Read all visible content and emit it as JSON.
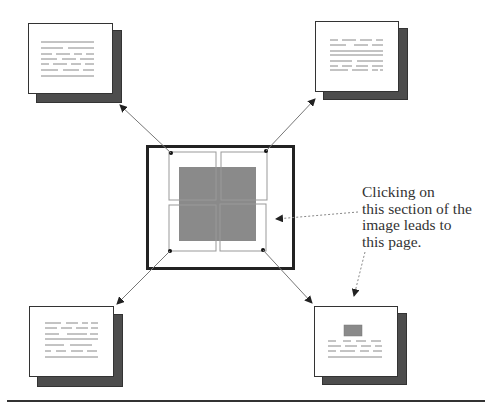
{
  "diagram": {
    "center_image": {
      "label": "image-map",
      "quadrants": [
        "top-left",
        "top-right",
        "bottom-left",
        "bottom-right"
      ],
      "fill_color": "#8a8a8a"
    },
    "linked_pages": [
      {
        "position": "top-left",
        "content": "text-lines"
      },
      {
        "position": "top-right",
        "content": "text-lines"
      },
      {
        "position": "bottom-left",
        "content": "text-lines"
      },
      {
        "position": "bottom-right",
        "content": "image-and-text"
      }
    ],
    "caption_lines": [
      "Clicking on",
      "this section of the",
      "image leads to",
      "this page."
    ],
    "colors": {
      "shadow": "#4d4d4d",
      "border": "#333333",
      "gray_square": "#8a8a8a",
      "arrow": "#777777"
    }
  }
}
